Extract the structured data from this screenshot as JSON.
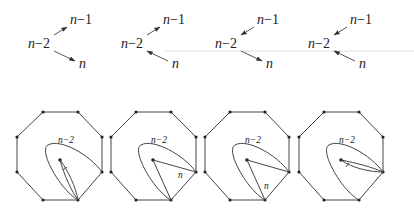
{
  "figure": {
    "top_row": {
      "label_from": "n",
      "label_dash": "−",
      "label_2": "2",
      "label_1": "1",
      "label_n": "n",
      "panels": [
        {
          "id": 1,
          "arrow_to_n_minus_1": "out",
          "arrow_to_n": "out"
        },
        {
          "id": 2,
          "arrow_to_n_minus_1": "out",
          "arrow_to_n": "in"
        },
        {
          "id": 3,
          "arrow_to_n_minus_1": "in",
          "arrow_to_n": "out"
        },
        {
          "id": 4,
          "arrow_to_n_minus_1": "in",
          "arrow_to_n": "in"
        }
      ]
    },
    "bottom_row": {
      "polygon": "octagon",
      "loop_label": "n−2",
      "edge_label": "n",
      "panels": [
        {
          "id": 1,
          "chord_label": ""
        },
        {
          "id": 2,
          "chord_label": "n"
        },
        {
          "id": 3,
          "chord_label": "n"
        },
        {
          "id": 4,
          "chord_label": ""
        }
      ]
    },
    "colors": {
      "ink": "#222222",
      "line": "#444444",
      "background": "#ffffff"
    }
  }
}
